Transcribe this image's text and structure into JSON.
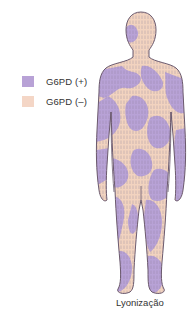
{
  "legend": {
    "items": [
      {
        "label": "G6PD (+)",
        "color": "#b8a2d6"
      },
      {
        "label": "G6PD (–)",
        "color": "#f4d6c6"
      }
    ]
  },
  "figure": {
    "outline_color": "#6b5a6e",
    "positive_color": "#b8a2d6",
    "negative_color": "#f2d3bf"
  },
  "caption": "Lyonização"
}
